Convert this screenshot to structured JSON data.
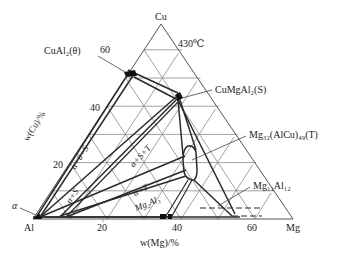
{
  "diagram": {
    "title_temp": "430℃",
    "vertices": {
      "top": "Cu",
      "left": "Al",
      "right": "Mg"
    },
    "axes": {
      "left_axis_label": "w(Cu)/%",
      "bottom_axis_label": "w(Mg)/%",
      "left_ticks": [
        "20",
        "40",
        "60"
      ],
      "bottom_ticks": [
        "20",
        "40",
        "60"
      ]
    },
    "phase_labels": {
      "theta": "CuAl₂(θ)",
      "s": "CuMgAl₂(S)",
      "t": "Mg₃₂(AlCu)₄₉(T)",
      "mg11al12": "Mg₁₁Al₁₂",
      "alpha": "α"
    },
    "region_labels": {
      "a_theta_s": "α+θ+S",
      "a_s_t": "α+S+T",
      "a_s": "α+S",
      "a_t": "α+T",
      "mg2al3": "Mg₂Al₃"
    },
    "phase_points": [
      {
        "name": "theta",
        "w_cu": 53,
        "w_mg": 0
      },
      {
        "name": "S",
        "w_cu": 43,
        "w_mg": 14
      },
      {
        "name": "T",
        "w_cu": 15,
        "w_mg": 28
      },
      {
        "name": "Mg2Al3",
        "w_cu": 0,
        "w_mg": 36
      },
      {
        "name": "Mg11Al12",
        "w_cu": 0,
        "w_mg": 56
      }
    ]
  }
}
